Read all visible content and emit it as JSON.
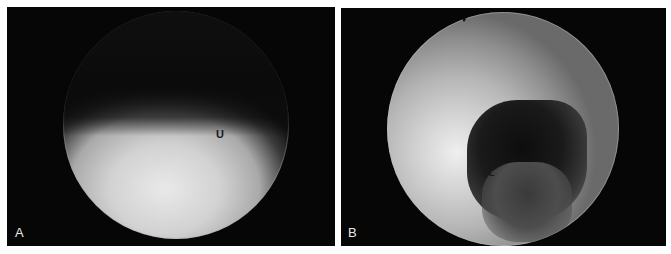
{
  "figure": {
    "panels": [
      {
        "letter": "A",
        "annotations": [
          {
            "text": "U"
          }
        ]
      },
      {
        "letter": "B",
        "annotations": [
          {
            "text": "L"
          }
        ]
      }
    ]
  }
}
